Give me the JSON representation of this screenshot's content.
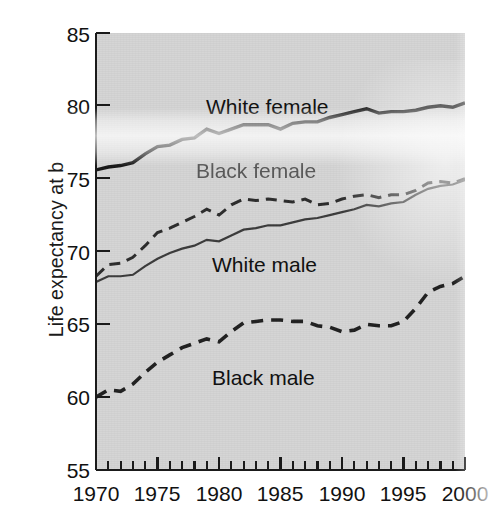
{
  "figure": {
    "ylabel": "Life expectancy at birth",
    "ylabel_visible": "Life expectancy at b",
    "background_color": "#d4d4d4",
    "line_color": "#1a1a1a"
  },
  "axes": {
    "y_ticks": [
      "85",
      "80",
      "75",
      "70",
      "65",
      "60",
      "55"
    ],
    "x_ticks": [
      "1970",
      "1975",
      "1980",
      "1985",
      "1990",
      "1995",
      "2000"
    ]
  },
  "labels": {
    "white_female": "White female",
    "black_female": "Black female",
    "white_male": "White male",
    "black_male": "Black male"
  },
  "chart_data": {
    "type": "line",
    "title": "",
    "xlabel": "",
    "ylabel": "Life expectancy at birth",
    "xlim": [
      1970,
      2000
    ],
    "ylim": [
      55,
      85
    ],
    "y_ticks": [
      55,
      60,
      65,
      70,
      75,
      80,
      85
    ],
    "x_ticks": [
      1970,
      1975,
      1980,
      1985,
      1990,
      1995,
      2000
    ],
    "x_minor_tick_interval": 1,
    "grid": false,
    "legend": "inline-annotations",
    "x": [
      1970,
      1971,
      1972,
      1973,
      1974,
      1975,
      1976,
      1977,
      1978,
      1979,
      1980,
      1981,
      1982,
      1983,
      1984,
      1985,
      1986,
      1987,
      1988,
      1989,
      1990,
      1991,
      1992,
      1993,
      1994,
      1995,
      1996,
      1997,
      1998,
      1999,
      2000
    ],
    "series": [
      {
        "name": "White female",
        "style": "solid",
        "width": "thick",
        "values": [
          75.6,
          75.8,
          75.9,
          76.1,
          76.7,
          77.2,
          77.3,
          77.7,
          77.8,
          78.4,
          78.1,
          78.4,
          78.7,
          78.7,
          78.7,
          78.4,
          78.8,
          78.9,
          78.9,
          79.2,
          79.4,
          79.6,
          79.8,
          79.5,
          79.6,
          79.6,
          79.7,
          79.9,
          80.0,
          79.9,
          80.2
        ]
      },
      {
        "name": "Black female",
        "style": "dashed",
        "width": "medium",
        "values": [
          68.3,
          69.1,
          69.2,
          69.6,
          70.4,
          71.3,
          71.6,
          72.0,
          72.4,
          72.9,
          72.5,
          73.2,
          73.6,
          73.5,
          73.6,
          73.5,
          73.4,
          73.6,
          73.2,
          73.3,
          73.6,
          73.8,
          73.9,
          73.7,
          73.9,
          73.9,
          74.2,
          74.7,
          74.8,
          74.7,
          75.0
        ]
      },
      {
        "name": "White male",
        "style": "solid",
        "width": "thin",
        "values": [
          67.9,
          68.3,
          68.3,
          68.4,
          69.0,
          69.5,
          69.9,
          70.2,
          70.4,
          70.8,
          70.7,
          71.1,
          71.5,
          71.6,
          71.8,
          71.8,
          72.0,
          72.2,
          72.3,
          72.5,
          72.7,
          72.9,
          73.2,
          73.1,
          73.3,
          73.4,
          73.9,
          74.3,
          74.5,
          74.6,
          74.9
        ]
      },
      {
        "name": "Black male",
        "style": "dashed",
        "width": "thick",
        "values": [
          60.0,
          60.5,
          60.4,
          60.9,
          61.7,
          62.4,
          62.9,
          63.4,
          63.7,
          64.0,
          63.8,
          64.5,
          65.1,
          65.2,
          65.3,
          65.3,
          65.2,
          65.2,
          64.9,
          64.8,
          64.5,
          64.6,
          65.0,
          64.9,
          64.9,
          65.2,
          66.1,
          67.2,
          67.6,
          67.8,
          68.3
        ]
      }
    ]
  }
}
